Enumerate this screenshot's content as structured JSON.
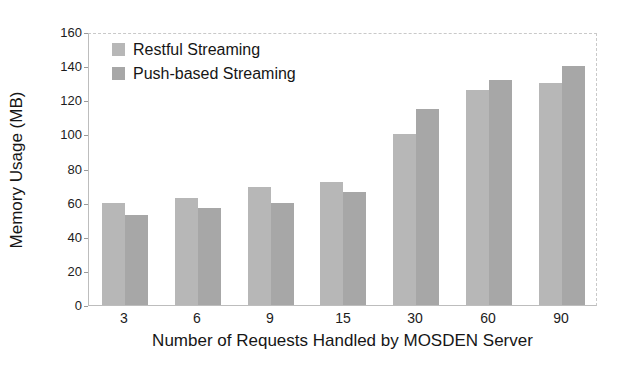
{
  "chart_data": {
    "type": "bar",
    "title": "",
    "xlabel": "Number of Requests Handled by MOSDEN Server",
    "ylabel": "Memory Usage (MB)",
    "categories": [
      "3",
      "6",
      "9",
      "15",
      "30",
      "60",
      "90"
    ],
    "series": [
      {
        "name": "Restful Streaming",
        "color": "#b7b7b7",
        "values": [
          60,
          63,
          69,
          72,
          100,
          126,
          130
        ]
      },
      {
        "name": "Push-based Streaming",
        "color": "#a7a7a7",
        "values": [
          53,
          57,
          60,
          66,
          115,
          132,
          140
        ]
      }
    ],
    "ylim": [
      0,
      160
    ],
    "yticks": [
      0,
      20,
      40,
      60,
      80,
      100,
      120,
      140,
      160
    ],
    "grid": false,
    "legend_position": "top-left",
    "bar_width_px": 23
  }
}
